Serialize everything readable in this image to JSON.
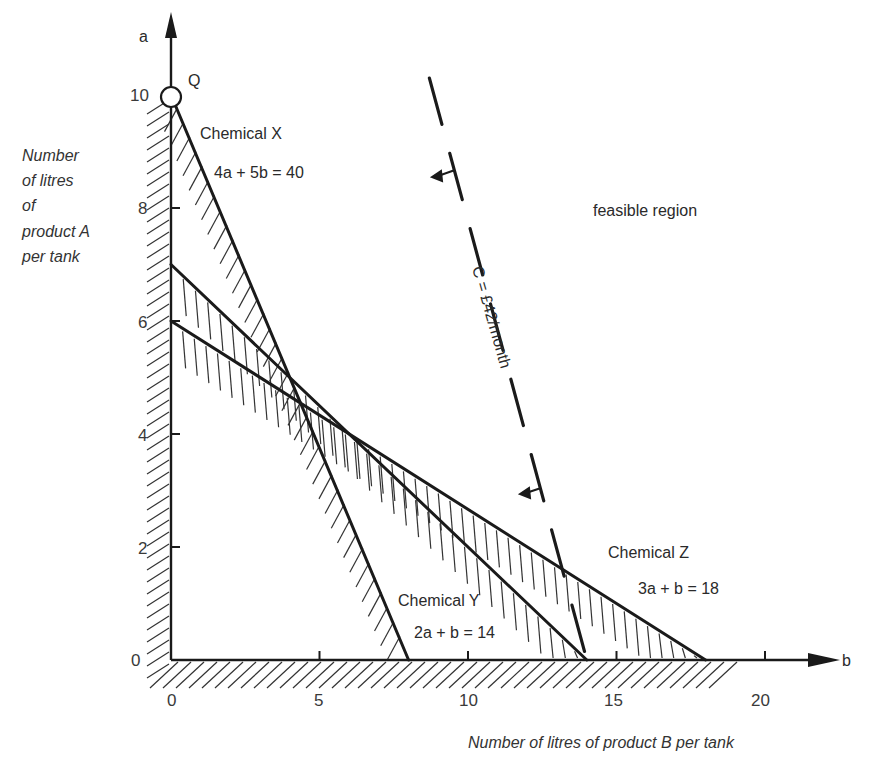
{
  "chart_data": {
    "type": "line",
    "title": "",
    "xlabel": "Number of litres of product B per tank",
    "ylabel": "Number of litres of product A per tank",
    "ylabel_lines": [
      "Number",
      "of litres",
      "of",
      "product A",
      "per tank"
    ],
    "x_axis_name": "b",
    "y_axis_name": "a",
    "xlim": [
      0,
      22
    ],
    "ylim": [
      0,
      10.5
    ],
    "x_ticks": [
      0,
      5,
      10,
      15,
      20
    ],
    "y_ticks": [
      0,
      2,
      4,
      6,
      8,
      10
    ],
    "grid": false,
    "legend": "none",
    "series": [
      {
        "name": "Chemical X",
        "equation": "4a + 5b = 40",
        "points": [
          [
            0,
            10
          ],
          [
            8,
            0
          ]
        ],
        "style": "solid",
        "hatch": "left"
      },
      {
        "name": "Chemical Y",
        "equation": "2a + b = 14",
        "points": [
          [
            0,
            7
          ],
          [
            14,
            0
          ]
        ],
        "style": "solid",
        "hatch": "below"
      },
      {
        "name": "Chemical Z",
        "equation": "3a + b = 18",
        "points": [
          [
            0,
            6
          ],
          [
            18,
            0
          ]
        ],
        "style": "solid",
        "hatch": "below"
      },
      {
        "name": "Cost line",
        "equation": "C = £42/month",
        "points": [
          [
            8.7,
            10.3
          ],
          [
            14,
            0
          ]
        ],
        "style": "dashed",
        "arrows": "toward origin"
      }
    ],
    "annotations": [
      {
        "text": "Q",
        "at": [
          0,
          10
        ],
        "marker": "open-circle"
      },
      {
        "text": "feasible region",
        "at": [
          15,
          8
        ]
      }
    ]
  },
  "labels": {
    "chemX_name": "Chemical X",
    "chemX_eq": "4a + 5b = 40",
    "chemY_name": "Chemical Y",
    "chemY_eq": "2a + b = 14",
    "chemZ_name": "Chemical Z",
    "chemZ_eq": "3a + b = 18",
    "cost_line": "C = £42/month",
    "feasible": "feasible region",
    "point_q": "Q",
    "y_axis_name": "a",
    "x_axis_name": "b",
    "xlabel": "Number of litres of product B per tank",
    "ylabel_1": "Number",
    "ylabel_2": "of litres",
    "ylabel_3": "of",
    "ylabel_4": "product A",
    "ylabel_5": "per tank",
    "xt0": "0",
    "xt5": "5",
    "xt10": "10",
    "xt15": "15",
    "xt20": "20",
    "yt0": "0",
    "yt2": "2",
    "yt4": "4",
    "yt6": "6",
    "yt8": "8",
    "yt10": "10"
  }
}
